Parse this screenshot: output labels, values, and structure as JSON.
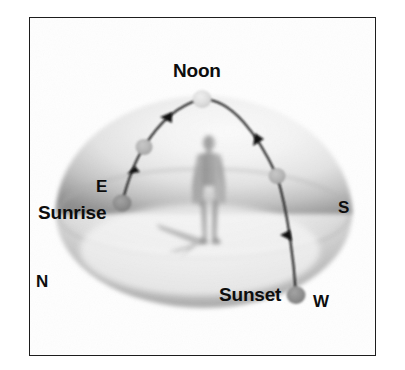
{
  "figure": {
    "frame": {
      "border_color": "#1d1d1d",
      "background_color": "#fefefe"
    }
  },
  "labels": {
    "noon": "Noon",
    "sunrise": "Sunrise",
    "sunset": "Sunset",
    "east": "E",
    "south": "S",
    "north": "N",
    "west": "W"
  },
  "colors": {
    "dome_light": "#f2f2f2",
    "dome_shadow": "#8e8e8e",
    "ground_light": "#f5f5f5",
    "ground_shadow": "#b9b9b9",
    "arc_line": "#141414",
    "sun_bright": "#dcdcdc",
    "sun_mid": "#b4b4b4",
    "sun_dark": "#8c8c8c",
    "figure_gray": "#9a9a9a",
    "shadow_gray": "#b0b0b0",
    "label_text": "#0d0d0d"
  },
  "scene": {
    "dome": {
      "center_x": 204,
      "center_y": 212,
      "radius_x": 148,
      "radius_y": 118
    },
    "horizon_ellipse": {
      "center_x": 204,
      "center_y": 214,
      "radius_x": 148,
      "radius_y": 46
    },
    "sun_path": {
      "description": "Arc of the Sun from sunrise in the east to sunset in the west passing through noon",
      "start": "Sunrise",
      "apex": "Noon",
      "end": "Sunset",
      "direction_arrows": 4
    },
    "sun_positions": [
      {
        "name": "sunrise-sun",
        "label": "Sunrise",
        "x": 122,
        "y": 203,
        "radius": 9,
        "tone": "sun_dark"
      },
      {
        "name": "morning-sun",
        "label": "Morning",
        "x": 144,
        "y": 147,
        "radius": 8,
        "tone": "sun_mid"
      },
      {
        "name": "noon-sun",
        "label": "Noon",
        "x": 202,
        "y": 99,
        "radius": 9,
        "tone": "sun_bright"
      },
      {
        "name": "afternoon-sun",
        "label": "Afternoon",
        "x": 277,
        "y": 176,
        "radius": 8,
        "tone": "sun_mid"
      },
      {
        "name": "sunset-sun",
        "label": "Sunset",
        "x": 296,
        "y": 295,
        "radius": 9,
        "tone": "sun_dark"
      }
    ],
    "observer": {
      "name": "human-figure",
      "x": 209,
      "top_y": 137,
      "bottom_y": 243,
      "height": 106
    },
    "cast_shadow": {
      "name": "observer-shadow",
      "from_x": 207,
      "from_y": 240,
      "to_x": 158,
      "to_y": 226
    },
    "compass_points": [
      "N",
      "E",
      "S",
      "W"
    ]
  }
}
